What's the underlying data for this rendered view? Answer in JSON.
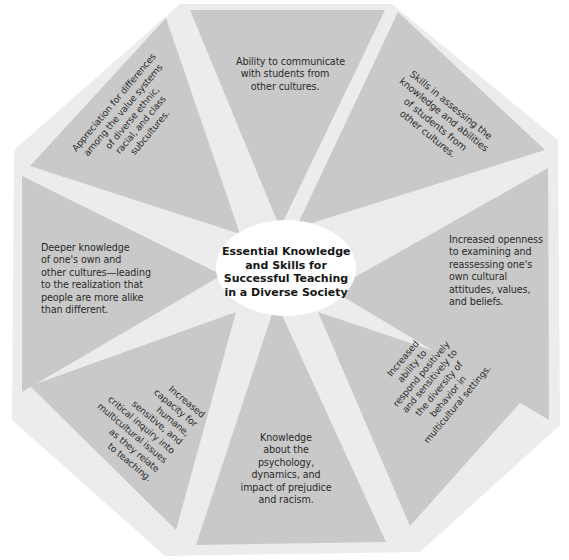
{
  "diagram": {
    "center_title": {
      "lines": [
        "Essential Knowledge",
        "and Skills for",
        "Successful Teaching",
        "in a Diverse Society"
      ]
    },
    "colors": {
      "background": "#ffffff",
      "octagon": "#ececec",
      "segment": "#c8c8c8",
      "text": "#2a2a2a"
    },
    "segments": [
      {
        "position": "top",
        "lines": [
          "Ability to communicate",
          "with students from",
          "other cultures."
        ]
      },
      {
        "position": "top-right",
        "lines": [
          "Skills in assessing the",
          "knowledge and abilities",
          "of students from",
          "other cultures."
        ]
      },
      {
        "position": "right",
        "lines": [
          "Increased openness",
          "to examining and",
          "reassessing one's",
          "own cultural",
          "attitudes, values,",
          "and beliefs."
        ]
      },
      {
        "position": "bottom-right",
        "lines": [
          "Increased",
          "ability to",
          "respond positively",
          "and sensitively to",
          "the diversity of",
          "behavior in",
          "multicultural settings."
        ]
      },
      {
        "position": "bottom",
        "lines": [
          "Knowledge",
          "about the",
          "psychology,",
          "dynamics, and",
          "impact of prejudice",
          "and racism."
        ]
      },
      {
        "position": "bottom-left",
        "lines": [
          "Increased",
          "capacity for",
          "humane,",
          "sensitive, and",
          "critical inquiry into",
          "multicultural issues",
          "as they relate",
          "to teaching."
        ]
      },
      {
        "position": "left",
        "lines": [
          "Deeper knowledge",
          "of one's own and",
          "other cultures—leading",
          "to the realization that",
          "people are more alike",
          "than different."
        ]
      },
      {
        "position": "top-left",
        "lines": [
          "Appreciation for differences",
          "among the value systems",
          "of diverse ethnic,",
          "racial, and class",
          "subcultures."
        ]
      }
    ]
  }
}
